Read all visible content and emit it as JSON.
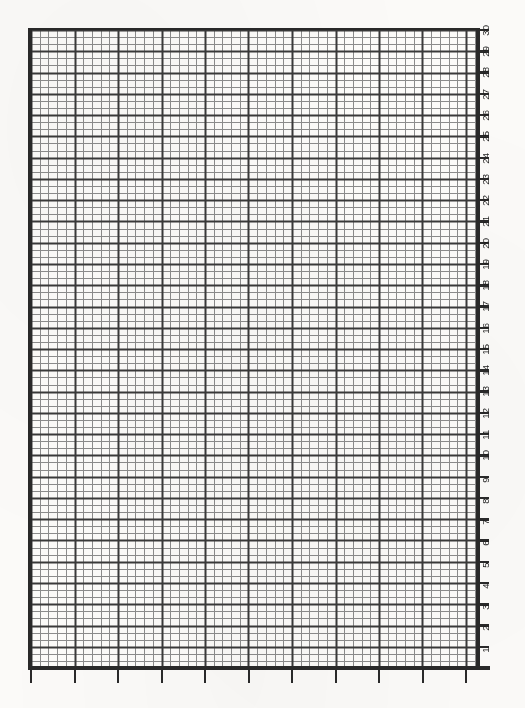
{
  "document": {
    "kind": "graph-paper",
    "title": "Graph Paper Grid",
    "background_color": "#fbfaf8",
    "line_color": "#2a2a2a"
  },
  "chart_data": {
    "type": "table",
    "title": "",
    "subtitle": "",
    "xlabel": "",
    "ylabel": "",
    "grid": true,
    "legend": null,
    "series": [],
    "values": [],
    "categories": [],
    "plot_area": {
      "left_px": 31,
      "top_px": 30,
      "width_px": 448,
      "height_px": 638
    },
    "y_axis": {
      "position": "right",
      "orientation": "vertical",
      "label_rotation_deg": -90,
      "direction": "bottom-to-top",
      "range": [
        0,
        30
      ],
      "major_rows": 30,
      "row_height_px": 21.27,
      "tick_labels": [
        "1",
        "2",
        "3",
        "4",
        "5",
        "6",
        "7",
        "8",
        "9",
        "10",
        "11",
        "12",
        "13",
        "14",
        "15",
        "16",
        "17",
        "18",
        "19",
        "20",
        "21",
        "22",
        "23",
        "24",
        "25",
        "26",
        "27",
        "28",
        "29",
        "30"
      ]
    },
    "x_axis": {
      "position": "bottom",
      "tick_labels": [],
      "major_divisions": 11,
      "major_spacing_px": 43.5,
      "minor_columns": 51,
      "minor_spacing_px": 8.7
    },
    "grid_spec": {
      "minor_cell_width_px": 8.7,
      "minor_cell_height_px": 7.09,
      "major_every_n_columns": 5,
      "major_every_n_rows": 3,
      "minor_line_color": "#8c8c8c",
      "major_line_color": "#3a3a3a"
    }
  }
}
